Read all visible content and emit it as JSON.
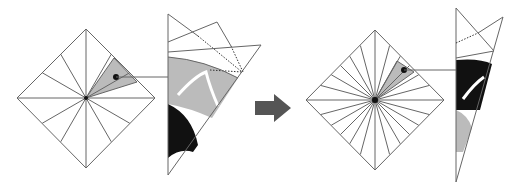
{
  "diagram": {
    "steps": [
      {
        "name": "step-1",
        "folds": 12,
        "cut_region": "gray wedge"
      },
      {
        "name": "step-2",
        "folds": 24,
        "cut_region": "gray wedge"
      }
    ],
    "colors": {
      "line": "#666666",
      "highlight": "#bbbbbb",
      "cut": "#111111",
      "arrow": "#555555"
    }
  }
}
